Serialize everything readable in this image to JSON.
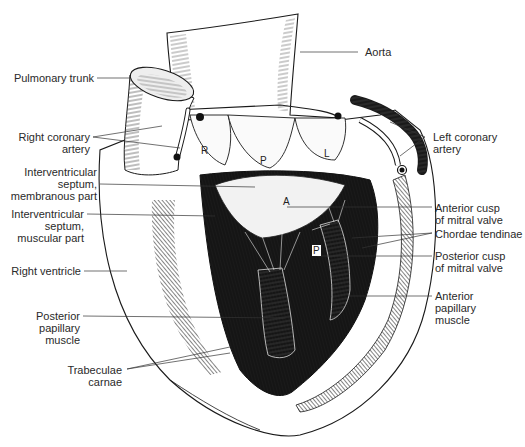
{
  "figure": {
    "labels_left": [
      {
        "id": "pulmonary-trunk",
        "lines": [
          "Pulmonary trunk"
        ]
      },
      {
        "id": "right-coronary-artery",
        "lines": [
          "Right coronary",
          "artery"
        ]
      },
      {
        "id": "iv-septum-membranous",
        "lines": [
          "Interventricular",
          "septum,",
          "membranous part"
        ]
      },
      {
        "id": "iv-septum-muscular",
        "lines": [
          "Interventricular",
          "septum,",
          "muscular part"
        ]
      },
      {
        "id": "right-ventricle",
        "lines": [
          "Right ventricle"
        ]
      },
      {
        "id": "posterior-papillary-muscle",
        "lines": [
          "Posterior",
          "papillary",
          "muscle"
        ]
      },
      {
        "id": "trabeculae-carnae",
        "lines": [
          "Trabeculae",
          "carnae"
        ]
      }
    ],
    "labels_right": [
      {
        "id": "aorta",
        "lines": [
          "Aorta"
        ]
      },
      {
        "id": "left-coronary-artery",
        "lines": [
          "Left coronary",
          "artery"
        ]
      },
      {
        "id": "anterior-cusp-mitral",
        "lines": [
          "Anterior cusp",
          "of mitral valve"
        ]
      },
      {
        "id": "chordae-tendinae",
        "lines": [
          "Chordae tendinae"
        ]
      },
      {
        "id": "posterior-cusp-mitral",
        "lines": [
          "Posterior cusp",
          "of mitral valve"
        ]
      },
      {
        "id": "anterior-papillary-muscle",
        "lines": [
          "Anterior",
          "papillary",
          "muscle"
        ]
      }
    ],
    "cusp_letters": {
      "right": "R",
      "posterior": "P",
      "left": "L",
      "anterior_mitral": "A",
      "posterior_mitral": "P"
    },
    "colors": {
      "ink": "#1a1a1a",
      "label_text": "#2a2a2a",
      "leader_line": "#333333",
      "background": "#ffffff"
    }
  }
}
